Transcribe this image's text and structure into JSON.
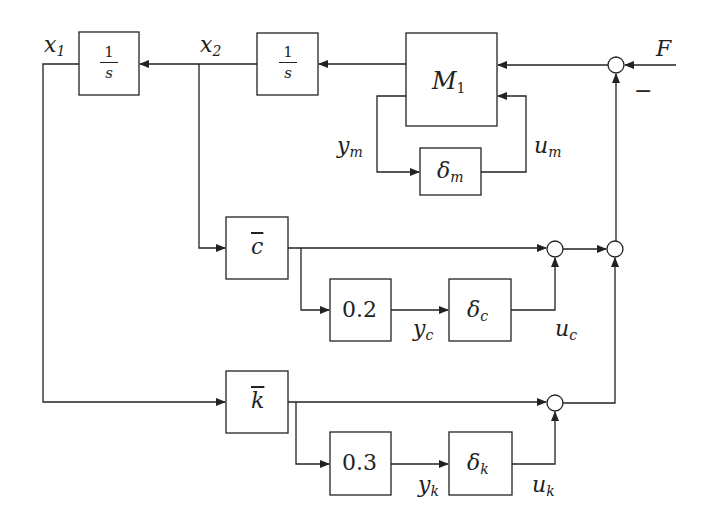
{
  "diagram": {
    "type": "block-diagram",
    "signals": {
      "x1": {
        "base": "x",
        "sub": "1"
      },
      "x2": {
        "base": "x",
        "sub": "2"
      },
      "F": "F",
      "minus": "−",
      "ym": {
        "base": "y",
        "sub": "m"
      },
      "um": {
        "base": "u",
        "sub": "m"
      },
      "yc": {
        "base": "y",
        "sub": "c"
      },
      "uc": {
        "base": "u",
        "sub": "c"
      },
      "yk": {
        "base": "y",
        "sub": "k"
      },
      "uk": {
        "base": "u",
        "sub": "k"
      }
    },
    "blocks": {
      "int1": {
        "num": "1",
        "den": "s"
      },
      "int2": {
        "num": "1",
        "den": "s"
      },
      "M1": {
        "base": "M",
        "sub": "1"
      },
      "delta_m": {
        "base": "δ",
        "sub": "m"
      },
      "cbar": "c",
      "gain_c": "0.2",
      "delta_c": {
        "base": "δ",
        "sub": "c"
      },
      "kbar": "k",
      "gain_k": "0.3",
      "delta_k": {
        "base": "δ",
        "sub": "k"
      }
    },
    "colors": {
      "line": "#222222",
      "background": "#ffffff"
    }
  }
}
